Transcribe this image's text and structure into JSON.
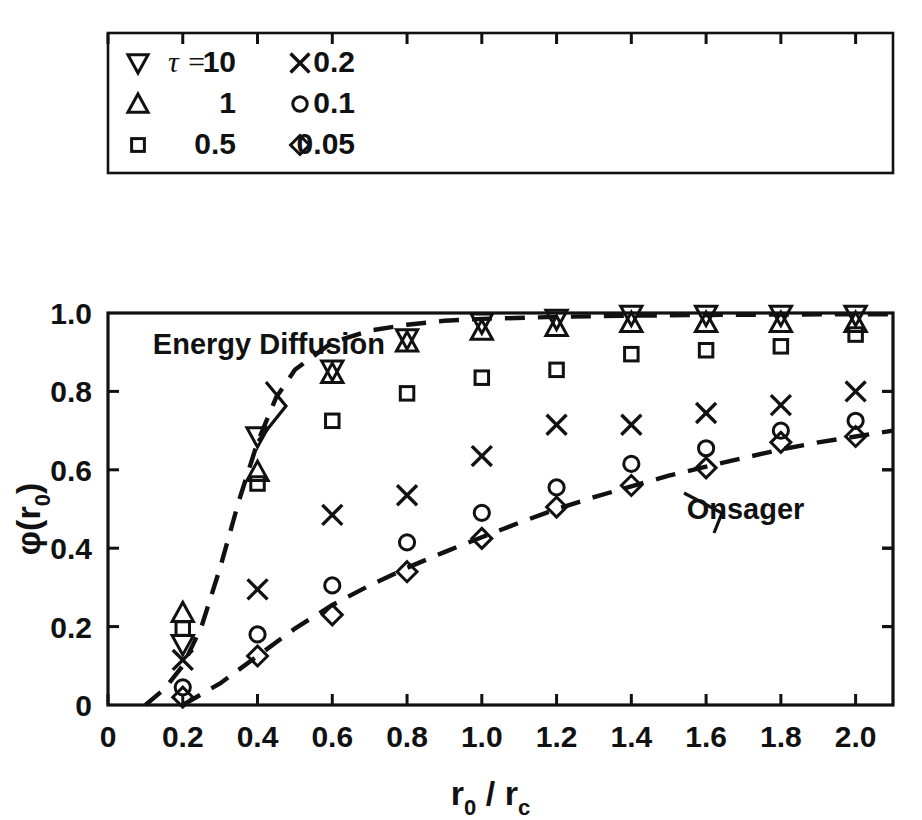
{
  "chart_data": {
    "type": "scatter",
    "title": "",
    "xlabel": "r0 / rc",
    "ylabel": "phi(r0)",
    "xlabel_main": "r",
    "xlabel_sub1": "0",
    "xlabel_slash": " / ",
    "xlabel_main2": "r",
    "xlabel_sub2": "c",
    "ylabel_phi": "φ",
    "ylabel_paren_open": "(",
    "ylabel_r": "r",
    "ylabel_sub": "0",
    "ylabel_paren_close": ")",
    "xlim": [
      0,
      2.1
    ],
    "ylim": [
      0,
      1.0
    ],
    "xticks": [
      0,
      0.2,
      0.4,
      0.6,
      0.8,
      1.0,
      1.2,
      1.4,
      1.6,
      1.8,
      2.0
    ],
    "xticklabels": [
      "0",
      "0.2",
      "0.4",
      "0.6",
      "0.8",
      "1.0",
      "1.2",
      "1.4",
      "1.6",
      "1.8",
      "2.0"
    ],
    "yticks": [
      0,
      0.2,
      0.4,
      0.6,
      0.8,
      1.0
    ],
    "yticklabels": [
      "0",
      "0.2",
      "0.4",
      "0.6",
      "0.8",
      "1.0"
    ],
    "grid": false,
    "legend_position": "top-inside-box",
    "legend_title": "τ =",
    "x": [
      0.2,
      0.4,
      0.6,
      0.8,
      1.0,
      1.2,
      1.4,
      1.6,
      1.8,
      2.0
    ],
    "series": [
      {
        "name": "10",
        "marker": "triangle-down",
        "values": [
          0.155,
          0.685,
          0.855,
          0.935,
          0.975,
          0.985,
          0.995,
          0.995,
          0.995,
          0.995
        ]
      },
      {
        "name": "1",
        "marker": "triangle-up",
        "values": [
          0.235,
          0.595,
          0.845,
          0.925,
          0.955,
          0.965,
          0.975,
          0.975,
          0.975,
          0.975
        ]
      },
      {
        "name": "0.5",
        "marker": "square",
        "values": [
          0.195,
          0.565,
          0.725,
          0.795,
          0.835,
          0.855,
          0.895,
          0.905,
          0.915,
          0.945
        ]
      },
      {
        "name": "0.2",
        "marker": "cross",
        "values": [
          0.115,
          0.295,
          0.485,
          0.535,
          0.635,
          0.715,
          0.715,
          0.745,
          0.765,
          0.8
        ]
      },
      {
        "name": "0.1",
        "marker": "circle",
        "values": [
          0.045,
          0.18,
          0.305,
          0.415,
          0.49,
          0.555,
          0.615,
          0.655,
          0.7,
          0.725
        ]
      },
      {
        "name": "0.05",
        "marker": "diamond",
        "values": [
          0.02,
          0.125,
          0.23,
          0.34,
          0.425,
          0.505,
          0.56,
          0.605,
          0.67,
          0.685
        ]
      }
    ],
    "curves": [
      {
        "name": "Energy Diffusion",
        "style": "dashed",
        "points": [
          [
            0.1,
            0.0
          ],
          [
            0.15,
            0.04
          ],
          [
            0.2,
            0.1
          ],
          [
            0.25,
            0.2
          ],
          [
            0.3,
            0.35
          ],
          [
            0.35,
            0.52
          ],
          [
            0.4,
            0.67
          ],
          [
            0.45,
            0.785
          ],
          [
            0.5,
            0.855
          ],
          [
            0.6,
            0.925
          ],
          [
            0.7,
            0.955
          ],
          [
            0.8,
            0.97
          ],
          [
            0.9,
            0.98
          ],
          [
            1.0,
            0.985
          ],
          [
            1.2,
            0.99
          ],
          [
            1.4,
            0.993
          ],
          [
            1.6,
            0.995
          ],
          [
            1.8,
            0.996
          ],
          [
            2.0,
            0.997
          ],
          [
            2.1,
            0.997
          ]
        ]
      },
      {
        "name": "Onsager",
        "style": "dashed",
        "points": [
          [
            0.2,
            0.0
          ],
          [
            0.3,
            0.055
          ],
          [
            0.4,
            0.125
          ],
          [
            0.5,
            0.195
          ],
          [
            0.6,
            0.255
          ],
          [
            0.7,
            0.305
          ],
          [
            0.8,
            0.35
          ],
          [
            0.9,
            0.39
          ],
          [
            1.0,
            0.428
          ],
          [
            1.1,
            0.465
          ],
          [
            1.2,
            0.5
          ],
          [
            1.3,
            0.53
          ],
          [
            1.4,
            0.558
          ],
          [
            1.5,
            0.585
          ],
          [
            1.6,
            0.608
          ],
          [
            1.7,
            0.63
          ],
          [
            1.8,
            0.652
          ],
          [
            1.9,
            0.67
          ],
          [
            2.0,
            0.685
          ],
          [
            2.1,
            0.7
          ]
        ]
      }
    ],
    "annotations": [
      {
        "text": "Energy Diffusion",
        "x": 0.12,
        "y": 0.92
      },
      {
        "text": "Onsager",
        "x": 1.5,
        "y": 0.5
      }
    ]
  },
  "legend": {
    "entries": [
      {
        "marker": "triangle-down",
        "prefix": "τ =",
        "label": "10",
        "col": 0,
        "row": 0
      },
      {
        "marker": "triangle-up",
        "prefix": "",
        "label": "1",
        "col": 0,
        "row": 1
      },
      {
        "marker": "square",
        "prefix": "",
        "label": "0.5",
        "col": 0,
        "row": 2
      },
      {
        "marker": "cross",
        "prefix": "",
        "label": "0.2",
        "col": 1,
        "row": 0
      },
      {
        "marker": "circle",
        "prefix": "",
        "label": "0.1",
        "col": 1,
        "row": 1
      },
      {
        "marker": "diamond",
        "prefix": "",
        "label": "0.05",
        "col": 1,
        "row": 2
      }
    ]
  },
  "colors": {
    "ink": "#111111",
    "background": "#ffffff"
  }
}
